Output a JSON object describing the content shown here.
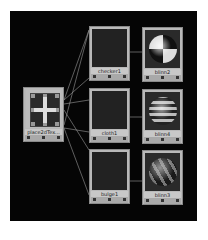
{
  "graph": {
    "background": "#050505",
    "source_node": {
      "label": "place2dTex...",
      "type": "place2dTexture"
    },
    "texture_nodes": [
      {
        "label": "checker1",
        "pattern": "checker"
      },
      {
        "label": "cloth1",
        "pattern": "cloth"
      },
      {
        "label": "bulge1",
        "pattern": "bulge"
      }
    ],
    "shader_nodes": [
      {
        "label": "blinn2",
        "preview": "checker-sphere"
      },
      {
        "label": "blinn4",
        "preview": "cloth-sphere"
      },
      {
        "label": "blinn3",
        "preview": "bulge-sphere"
      }
    ],
    "connection_color": "#9a9a9a"
  }
}
